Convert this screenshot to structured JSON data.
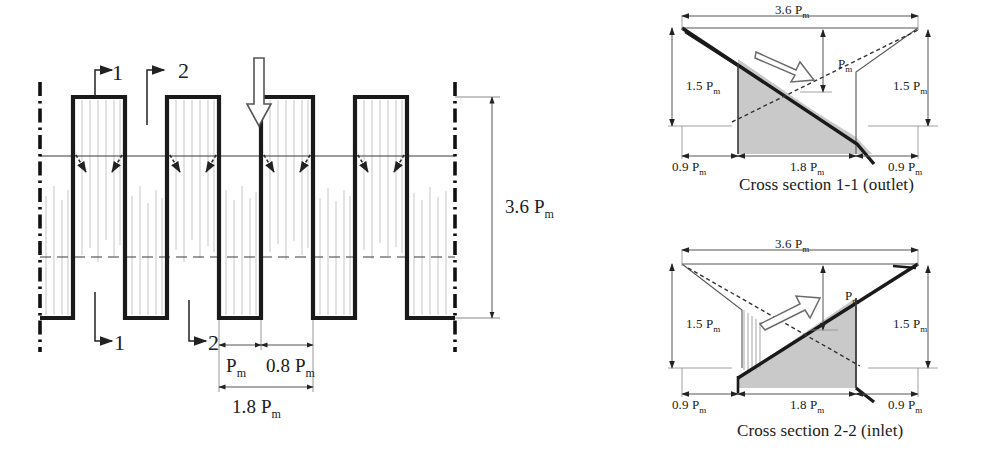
{
  "figure": {
    "title_visible": false,
    "background": "#ffffff",
    "ink": "#1a1a1a",
    "shade_fill": "#c9c9c9",
    "faint_line": "#b5b5b5"
  },
  "plan_view": {
    "name": "serpentine-channel-plan-view",
    "section_marks": {
      "top": [
        {
          "label": "1",
          "x": 120,
          "y": 74
        },
        {
          "label": "2",
          "x": 186,
          "y": 72
        }
      ],
      "bottom": [
        {
          "label": "1",
          "x": 120,
          "y": 345
        },
        {
          "label": "2",
          "x": 186,
          "y": 345
        }
      ]
    },
    "flow_arrow": {
      "name": "flow-direction-arrow",
      "direction": "down",
      "x": 259,
      "y_top": 58,
      "y_bottom": 127
    },
    "dimensions": {
      "vertical_right": {
        "label": "3.6 P",
        "sub": "m",
        "value": "3.6 Pm"
      },
      "pitch_ridge": {
        "label": "P",
        "sub": "m",
        "value": "Pm"
      },
      "pitch_groove": {
        "label": "0.8 P",
        "sub": "m",
        "value": "0.8 Pm"
      },
      "pitch_total": {
        "label": "1.8 P",
        "sub": "m",
        "value": "1.8 Pm"
      }
    },
    "geometry": {
      "left_centerline_x": 40,
      "right_centerline_x": 455,
      "top_y": 97,
      "bottom_y": 318,
      "mid_upper_y": 156,
      "mid_lower_y": 257,
      "ridge_width": 52,
      "groove_width": 42,
      "period": 94,
      "ridge_starts": [
        73,
        167,
        261,
        355
      ]
    }
  },
  "cross_sections": [
    {
      "id": "section-1-1",
      "name": "cross-section-outlet",
      "caption": "Cross section 1-1 (outlet)",
      "caption_x": 742,
      "caption_y": 176,
      "origin": {
        "x": 665,
        "y": 8
      },
      "width_label": "3.6 P",
      "width_sub": "m",
      "height_left_label": "1.5 P",
      "height_left_sub": "m",
      "height_right_label": "1.5 P",
      "height_right_sub": "m",
      "mid_height_label": "P",
      "mid_height_sub": "m",
      "base_left_label": "0.9 P",
      "base_left_sub": "m",
      "base_mid_label": "1.8 P",
      "base_mid_sub": "m",
      "base_right_label": "0.9 P",
      "base_right_sub": "m",
      "flow_arrow": {
        "name": "flow-arrow-outlet",
        "direction": "down-right"
      },
      "profile": "descending"
    },
    {
      "id": "section-2-2",
      "name": "cross-section-inlet",
      "caption": "Cross section 2-2  (inlet)",
      "caption_x": 742,
      "caption_y": 422,
      "origin": {
        "x": 665,
        "y": 244
      },
      "width_label": "3.6 P",
      "width_sub": "m",
      "height_left_label": "1.5 P",
      "height_left_sub": "m",
      "height_right_label": "1.5 P",
      "height_right_sub": "m",
      "mid_height_label": "P",
      "mid_height_sub": "m",
      "base_left_label": "0.9 P",
      "base_left_sub": "m",
      "base_mid_label": "1.8 P",
      "base_mid_sub": "m",
      "base_right_label": "0.9 P",
      "base_right_sub": "m",
      "flow_arrow": {
        "name": "flow-arrow-inlet",
        "direction": "up-right"
      },
      "profile": "ascending"
    }
  ]
}
